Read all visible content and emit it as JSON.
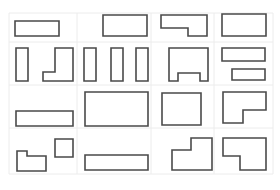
{
  "diagram": {
    "type": "shape-grid",
    "background": "#ffffff",
    "grid_color": "#ececec",
    "stroke_color": "#4a4a4a",
    "rows": 4,
    "cols": 4,
    "grid": {
      "x": [
        9,
        77,
        151,
        214,
        273
      ],
      "y": [
        13,
        42,
        85,
        128,
        174
      ]
    },
    "cells": [
      {
        "row": 0,
        "col": 0,
        "shapes": [
          {
            "kind": "rect",
            "points": "15,21 59,21 59,36 15,36"
          }
        ]
      },
      {
        "row": 0,
        "col": 1,
        "shapes": [
          {
            "kind": "rect",
            "points": "103,15 147,15 147,36 103,36"
          }
        ]
      },
      {
        "row": 0,
        "col": 2,
        "shapes": [
          {
            "kind": "l-shape",
            "points": "161,15 207,15 207,36 188,36 188,28 161,28"
          }
        ]
      },
      {
        "row": 0,
        "col": 3,
        "shapes": [
          {
            "kind": "rect",
            "points": "222,14 266,14 266,36 222,36"
          }
        ]
      },
      {
        "row": 1,
        "col": 0,
        "shapes": [
          {
            "kind": "rect",
            "points": "16,48 28,48 28,81 16,81"
          },
          {
            "kind": "l-shape",
            "points": "55,48 73,48 73,81 43,81 43,72 55,72"
          }
        ]
      },
      {
        "row": 1,
        "col": 1,
        "shapes": [
          {
            "kind": "rect",
            "points": "84,48 96,48 96,81 84,81"
          },
          {
            "kind": "rect",
            "points": "111,48 123,48 123,81 111,81"
          },
          {
            "kind": "rect",
            "points": "136,48 148,48 148,81 136,81"
          }
        ]
      },
      {
        "row": 1,
        "col": 2,
        "shapes": [
          {
            "kind": "notched-rect",
            "points": "169,48 208,48 208,81 200,81 200,73 178,73 178,81 169,81"
          }
        ]
      },
      {
        "row": 1,
        "col": 3,
        "shapes": [
          {
            "kind": "rect",
            "points": "222,48 265,48 265,61 222,61"
          },
          {
            "kind": "rect",
            "points": "232,69 265,69 265,80 232,80"
          }
        ]
      },
      {
        "row": 2,
        "col": 0,
        "shapes": [
          {
            "kind": "rect",
            "points": "16,111 73,111 73,126 16,126"
          }
        ]
      },
      {
        "row": 2,
        "col": 1,
        "shapes": [
          {
            "kind": "rect",
            "points": "85,92 148,92 148,126 85,126"
          }
        ]
      },
      {
        "row": 2,
        "col": 2,
        "shapes": [
          {
            "kind": "rect",
            "points": "162,93 201,93 201,125 162,125"
          }
        ]
      },
      {
        "row": 2,
        "col": 3,
        "shapes": [
          {
            "kind": "l-shape",
            "points": "223,92 266,92 266,110 243,110 243,123 223,123"
          }
        ]
      },
      {
        "row": 3,
        "col": 0,
        "shapes": [
          {
            "kind": "notched-rect",
            "points": "17,151 27,151 27,156 46,156 46,171 17,171"
          },
          {
            "kind": "square",
            "points": "55,139 73,139 73,157 55,157"
          }
        ]
      },
      {
        "row": 3,
        "col": 1,
        "shapes": [
          {
            "kind": "rect",
            "points": "85,155 148,155 148,170 85,170"
          }
        ]
      },
      {
        "row": 3,
        "col": 2,
        "shapes": [
          {
            "kind": "l-shape",
            "points": "191,138 212,138 212,170 172,170 172,150 191,150"
          }
        ]
      },
      {
        "row": 3,
        "col": 3,
        "shapes": [
          {
            "kind": "l-shape",
            "points": "223,138 266,138 266,170 240,170 240,156 223,156"
          }
        ]
      }
    ]
  }
}
